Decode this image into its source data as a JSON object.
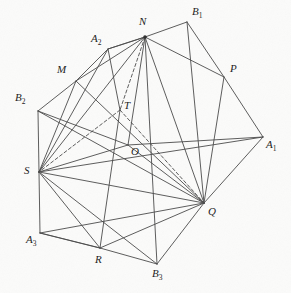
{
  "figure": {
    "background_color": "#fbfbfa",
    "line_color": "#4a4a4a",
    "label_color": "#1c1c1c",
    "width": 291,
    "height": 293,
    "vertices": [
      {
        "id": "N",
        "label": "N",
        "sub": "",
        "x": 145,
        "y": 37,
        "lx": 139,
        "ly": 16,
        "dot": true
      },
      {
        "id": "B1",
        "label": "B",
        "sub": "1",
        "x": 187,
        "y": 22,
        "lx": 192,
        "ly": 6,
        "dot": false
      },
      {
        "id": "A2",
        "label": "A",
        "sub": "2",
        "x": 108,
        "y": 49,
        "lx": 91,
        "ly": 33,
        "dot": false
      },
      {
        "id": "M",
        "label": "M",
        "sub": "",
        "x": 76,
        "y": 81,
        "lx": 57,
        "ly": 64,
        "dot": false
      },
      {
        "id": "P",
        "label": "P",
        "sub": "",
        "x": 224,
        "y": 77,
        "lx": 230,
        "ly": 63,
        "dot": false
      },
      {
        "id": "B2",
        "label": "B",
        "sub": "2",
        "x": 38,
        "y": 111,
        "lx": 15,
        "ly": 92,
        "dot": false
      },
      {
        "id": "T",
        "label": "T",
        "sub": "",
        "x": 120,
        "y": 110,
        "lx": 124,
        "ly": 100,
        "dot": false
      },
      {
        "id": "A1",
        "label": "A",
        "sub": "1",
        "x": 263,
        "y": 137,
        "lx": 266,
        "ly": 139,
        "dot": false
      },
      {
        "id": "O",
        "label": "O",
        "sub": "",
        "x": 128,
        "y": 145,
        "lx": 131,
        "ly": 146,
        "dot": false
      },
      {
        "id": "S",
        "label": "S",
        "sub": "",
        "x": 39,
        "y": 172,
        "lx": 24,
        "ly": 165,
        "dot": false
      },
      {
        "id": "Q",
        "label": "Q",
        "sub": "",
        "x": 204,
        "y": 203,
        "lx": 208,
        "ly": 206,
        "dot": false
      },
      {
        "id": "A3",
        "label": "A",
        "sub": "3",
        "x": 40,
        "y": 233,
        "lx": 26,
        "ly": 234,
        "dot": false
      },
      {
        "id": "R",
        "label": "R",
        "sub": "",
        "x": 100,
        "y": 248,
        "lx": 95,
        "ly": 254,
        "dot": false
      },
      {
        "id": "B3",
        "label": "B",
        "sub": "3",
        "x": 157,
        "y": 264,
        "lx": 152,
        "ly": 268,
        "dot": false
      }
    ],
    "edges_solid": [
      [
        "N",
        "B1"
      ],
      [
        "B1",
        "P"
      ],
      [
        "P",
        "A1"
      ],
      [
        "A1",
        "Q"
      ],
      [
        "Q",
        "B3"
      ],
      [
        "B3",
        "R"
      ],
      [
        "R",
        "A3"
      ],
      [
        "A3",
        "S"
      ],
      [
        "S",
        "B2"
      ],
      [
        "B2",
        "M"
      ],
      [
        "M",
        "A2"
      ],
      [
        "A2",
        "N"
      ],
      [
        "N",
        "M"
      ],
      [
        "N",
        "A2"
      ],
      [
        "N",
        "S"
      ],
      [
        "N",
        "O"
      ],
      [
        "N",
        "P"
      ],
      [
        "N",
        "Q"
      ],
      [
        "N",
        "B3"
      ],
      [
        "B1",
        "Q"
      ],
      [
        "P",
        "Q"
      ],
      [
        "M",
        "S"
      ],
      [
        "A2",
        "S"
      ],
      [
        "B2",
        "Q"
      ],
      [
        "B2",
        "O"
      ],
      [
        "S",
        "Q"
      ],
      [
        "S",
        "O"
      ],
      [
        "S",
        "A1"
      ],
      [
        "S",
        "R"
      ],
      [
        "S",
        "B3"
      ],
      [
        "A3",
        "R"
      ],
      [
        "A3",
        "Q"
      ],
      [
        "R",
        "Q"
      ],
      [
        "O",
        "A1"
      ],
      [
        "O",
        "Q"
      ],
      [
        "M",
        "Q"
      ],
      [
        "A2",
        "T"
      ],
      [
        "T",
        "R"
      ]
    ],
    "edges_dashed": [
      [
        "N",
        "T"
      ],
      [
        "T",
        "S"
      ],
      [
        "T",
        "Q"
      ]
    ]
  }
}
